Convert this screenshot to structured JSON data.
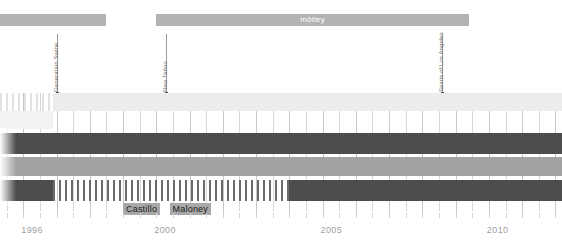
{
  "chart_data": {
    "type": "timeline",
    "title": "",
    "xlabel": "",
    "ylabel": "",
    "xlim": [
      1995.3,
      2012.2
    ],
    "grid": true,
    "axis": {
      "tick_labels": [
        "1996",
        "2000",
        "2005",
        "2010"
      ],
      "tick_values": [
        1996,
        2000,
        2005,
        2010
      ],
      "minor_tick_step": 0.5
    },
    "top_bars": [
      {
        "label": "",
        "start": 1995.3,
        "end": 1998.5
      },
      {
        "label": "mötley",
        "start": 2000.0,
        "end": 2009.4
      }
    ],
    "events": [
      {
        "label": "Generation Swine",
        "year": 1997.0
      },
      {
        "label": "New Tattoo",
        "year": 2000.3
      },
      {
        "label": "Saints of Los Angeles",
        "year": 2008.6
      }
    ],
    "rows": [
      {
        "name": "row-1",
        "segments": [
          {
            "style": "hatch-light",
            "start": 1995.3,
            "end": 1996.9
          },
          {
            "style": "light",
            "start": 1996.9,
            "end": 2012.2
          }
        ]
      },
      {
        "name": "row-2",
        "segments": [
          {
            "style": "pale",
            "start": 1995.3,
            "end": 1996.9
          }
        ]
      },
      {
        "name": "row-3",
        "segments": [
          {
            "style": "dark",
            "start": 1995.3,
            "end": 2012.2
          }
        ]
      },
      {
        "name": "row-4",
        "segments": [
          {
            "style": "mid",
            "start": 1995.3,
            "end": 2012.2
          }
        ]
      },
      {
        "name": "row-5",
        "segments": [
          {
            "style": "dark",
            "start": 1995.3,
            "end": 1996.9
          },
          {
            "style": "hatch-dark",
            "start": 1996.9,
            "end": 2004.0
          },
          {
            "style": "dark",
            "start": 2004.0,
            "end": 2012.2
          }
        ]
      }
    ],
    "name_labels": [
      {
        "text": "Castillo",
        "start": 1999.0,
        "end": 2000.3
      },
      {
        "text": "Maloney",
        "start": 2000.4,
        "end": 2002.2
      }
    ],
    "colors": {
      "dark": "#4d4d4d",
      "mid": "#a3a3a3",
      "light": "#ececec",
      "top_bar": "#b3b3b3",
      "name_label_bg": "#a8a8a8",
      "grid": "#d8d8d8",
      "axis_text": "#a0a0a0",
      "event_text": "#6e6e6e"
    }
  }
}
